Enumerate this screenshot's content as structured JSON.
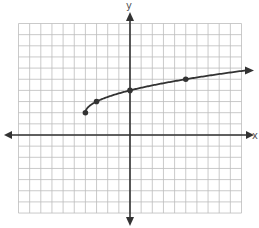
{
  "chart_data": {
    "type": "line",
    "title": "",
    "xlabel": "x",
    "ylabel": "y",
    "xlim": [
      -10,
      10
    ],
    "ylim": [
      -7,
      10
    ],
    "grid": true,
    "grid_step": 1,
    "function": "y = sqrt(x + 4) + 2",
    "series": [
      {
        "name": "curve",
        "start_point": {
          "x": -4,
          "y": 2
        },
        "marked_points": [
          {
            "x": -4,
            "y": 2
          },
          {
            "x": -3,
            "y": 3
          },
          {
            "x": 0,
            "y": 4
          },
          {
            "x": 5,
            "y": 5
          }
        ],
        "continues_right": true
      }
    ]
  },
  "axes": {
    "x_label": "x",
    "y_label": "y"
  },
  "colors": {
    "grid": "#bdbdbd",
    "axis": "#333333",
    "curve": "#333333",
    "background": "#ffffff"
  }
}
